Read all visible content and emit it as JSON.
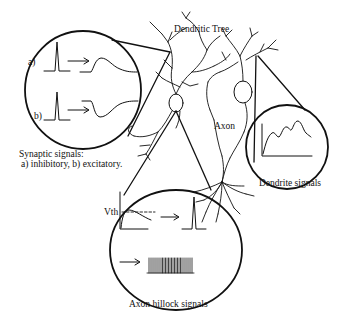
{
  "figure": {
    "labels": {
      "dendritic_tree": "Dendritic Tree",
      "axon": "Axon",
      "dendrite_signals": "Dendrite signals",
      "synaptic_title": "Synaptic signals:",
      "synaptic_legend": "a) inhibitory, b) excitatory.",
      "axon_hillock_signals": "Axon hillock signals",
      "vth": "Vth",
      "a": "a)",
      "b": "b)"
    },
    "colors": {
      "ink": "#111111",
      "background": "#ffffff"
    }
  }
}
